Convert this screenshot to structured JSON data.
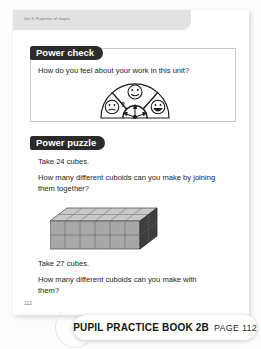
{
  "document": {
    "unit_label": "Unit 9: Properties of shapes",
    "folio": "112"
  },
  "power_check": {
    "heading": "Power check",
    "question": "How do you feel about your work in this unit?",
    "dial": {
      "segments": [
        {
          "position": "left",
          "face": "confused-face",
          "marker": "?"
        },
        {
          "position": "middle",
          "face": "neutral-smile-face",
          "marker": ""
        },
        {
          "position": "right",
          "face": "big-smile-face",
          "marker": ""
        }
      ],
      "center": "compass-arrows"
    }
  },
  "power_puzzle": {
    "heading": "Power puzzle",
    "take_24": "Take 24 cubes.",
    "question_24": "How many different cuboids can you make by joining them together?",
    "take_27": "Take 27 cubes.",
    "question_27": "How many different cuboids can you make with them?",
    "cuboid": {
      "width_cubes": 6,
      "height_cubes": 2,
      "depth_cubes": 2,
      "total_cubes": 24,
      "front_color": "#a8a8a8",
      "top_color": "#c8c8c8",
      "side_color": "#3c3c3c"
    }
  },
  "footer": {
    "book_label": "PUPIL PRACTICE BOOK 2B",
    "page_label": "PAGE 112"
  }
}
